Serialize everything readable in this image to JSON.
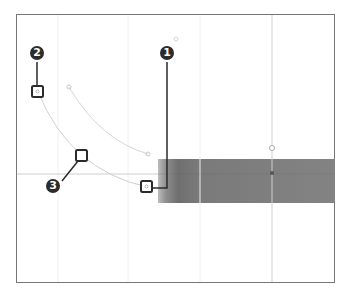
{
  "diagram": {
    "title": "",
    "callouts": [
      {
        "id": "1",
        "label": "1",
        "target": "anchor-point-bottom"
      },
      {
        "id": "2",
        "label": "2",
        "target": "anchor-point-top"
      },
      {
        "id": "3",
        "label": "3",
        "target": "curve-midpoint"
      }
    ],
    "colors": {
      "frame": "#777777",
      "guide": "#d0d0d0",
      "curve": "#cfcfcf",
      "handle": "#2b2b2b",
      "band": "#838383"
    }
  }
}
